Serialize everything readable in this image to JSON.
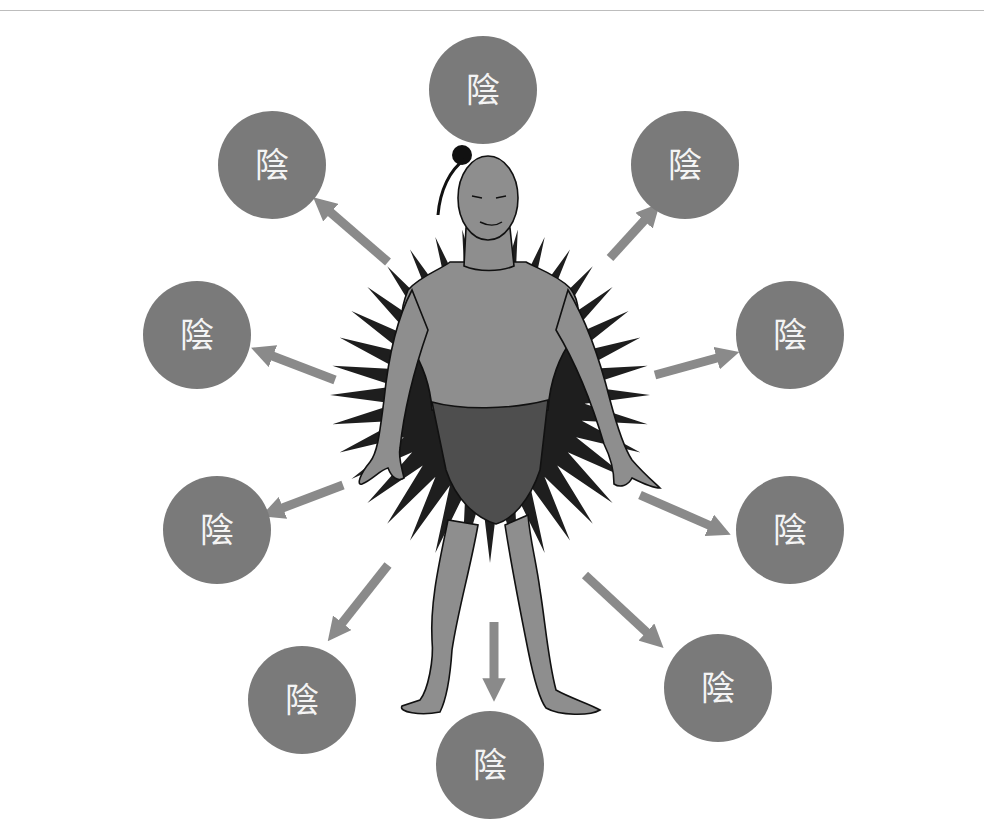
{
  "diagram": {
    "colors": {
      "background": "#ffffff",
      "circle_fill": "#7a7a7a",
      "circle_text": "#f4f4f4",
      "arrow": "#8a8a8a",
      "burst": "#1e1e1e",
      "skin": "#8e8e8e",
      "loincloth": "#4e4e4e",
      "outline": "#111111",
      "rule": "#bdbdbd"
    },
    "nodes": [
      {
        "id": "top",
        "label": "陰",
        "cx": 483,
        "cy": 90,
        "r": 54
      },
      {
        "id": "upper-right",
        "label": "陰",
        "cx": 685,
        "cy": 165,
        "r": 54
      },
      {
        "id": "right",
        "label": "陰",
        "cx": 790,
        "cy": 335,
        "r": 54
      },
      {
        "id": "lower-right",
        "label": "陰",
        "cx": 790,
        "cy": 530,
        "r": 54
      },
      {
        "id": "bottom-right",
        "label": "陰",
        "cx": 718,
        "cy": 688,
        "r": 54
      },
      {
        "id": "bottom",
        "label": "陰",
        "cx": 490,
        "cy": 765,
        "r": 54
      },
      {
        "id": "bottom-left",
        "label": "陰",
        "cx": 302,
        "cy": 700,
        "r": 54
      },
      {
        "id": "lower-left",
        "label": "陰",
        "cx": 217,
        "cy": 530,
        "r": 54
      },
      {
        "id": "left",
        "label": "陰",
        "cx": 197,
        "cy": 335,
        "r": 54
      },
      {
        "id": "upper-left",
        "label": "陰",
        "cx": 272,
        "cy": 165,
        "r": 54
      }
    ],
    "arrows": [
      {
        "target": "upper-right",
        "x1": 610,
        "y1": 258,
        "x2": 652,
        "y2": 212
      },
      {
        "target": "right",
        "x1": 655,
        "y1": 375,
        "x2": 728,
        "y2": 355
      },
      {
        "target": "lower-right",
        "x1": 640,
        "y1": 495,
        "x2": 720,
        "y2": 530
      },
      {
        "target": "bottom-right",
        "x1": 585,
        "y1": 575,
        "x2": 655,
        "y2": 640
      },
      {
        "target": "bottom",
        "x1": 494,
        "y1": 622,
        "x2": 494,
        "y2": 690
      },
      {
        "target": "bottom-left",
        "x1": 388,
        "y1": 565,
        "x2": 335,
        "y2": 632
      },
      {
        "target": "lower-left",
        "x1": 343,
        "y1": 485,
        "x2": 272,
        "y2": 512
      },
      {
        "target": "left",
        "x1": 335,
        "y1": 380,
        "x2": 262,
        "y2": 352
      },
      {
        "target": "upper-left",
        "x1": 388,
        "y1": 262,
        "x2": 322,
        "y2": 205
      }
    ],
    "burst": {
      "cx": 490,
      "cy": 395,
      "inner_r": 95,
      "outer_r": 160,
      "spikes": 36
    }
  }
}
